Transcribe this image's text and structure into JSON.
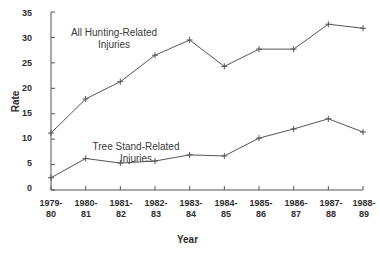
{
  "chart_data": {
    "type": "line",
    "title": "",
    "subtitle": "",
    "xlabel": "Year",
    "ylabel": "Rate",
    "categories": [
      "1979-\n80",
      "1980-\n81",
      "1981-\n82",
      "1982-\n83",
      "1983-\n84",
      "1984-\n85",
      "1985-\n86",
      "1986-\n87",
      "1987-\n88",
      "1988-\n89"
    ],
    "category_lines": [
      [
        "1979-",
        "80"
      ],
      [
        "1980-",
        "81"
      ],
      [
        "1981-",
        "82"
      ],
      [
        "1982-",
        "83"
      ],
      [
        "1983-",
        "84"
      ],
      [
        "1984-",
        "85"
      ],
      [
        "1985-",
        "86"
      ],
      [
        "1986-",
        "87"
      ],
      [
        "1987-",
        "88"
      ],
      [
        "1988-",
        "89"
      ]
    ],
    "series": [
      {
        "name": "All Hunting-Related Injuries",
        "marker": "plus",
        "values": [
          11.2,
          17.9,
          21.3,
          26.5,
          29.5,
          24.3,
          27.7,
          27.7,
          32.6,
          31.8
        ]
      },
      {
        "name": "Tree Stand-Related Injuries",
        "marker": "plus",
        "values": [
          2.4,
          6.2,
          5.3,
          5.7,
          6.9,
          6.7,
          10.2,
          12.0,
          14.0,
          11.4
        ]
      }
    ],
    "annotations": [
      {
        "id": "hunting",
        "line1": "All Hunting-Related",
        "line2": "Injuries"
      },
      {
        "id": "treestand",
        "line1": "Tree Stand-Related",
        "line2": "Injuries"
      }
    ],
    "ylim": [
      0,
      35
    ],
    "yticks": [
      0,
      5,
      10,
      15,
      20,
      25,
      30,
      35
    ],
    "ytick_labels": [
      "0",
      "5",
      "10",
      "15",
      "20",
      "25",
      "30",
      "35"
    ],
    "grid": false,
    "legend": "inline-annotations",
    "line_color": "#555555",
    "axis_color": "#555555"
  }
}
